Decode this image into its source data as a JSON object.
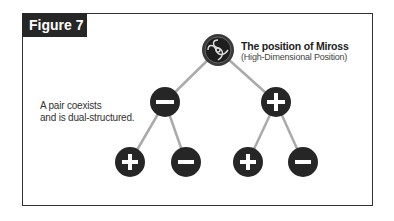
{
  "figure": {
    "label": "Figure 7"
  },
  "root": {
    "title": "The position of Miross",
    "subtitle": "(High-Dimensional Position)",
    "icon": "miross-knot-icon"
  },
  "annotation": {
    "line1": "A pair coexists",
    "line2": "and is dual-structured."
  },
  "nodes": {
    "level1": [
      {
        "sign": "minus",
        "symbol": "−"
      },
      {
        "sign": "plus",
        "symbol": "+"
      }
    ],
    "level2": [
      {
        "sign": "plus",
        "symbol": "+"
      },
      {
        "sign": "minus",
        "symbol": "−"
      },
      {
        "sign": "plus",
        "symbol": "+"
      },
      {
        "sign": "minus",
        "symbol": "−"
      }
    ]
  },
  "colors": {
    "node_fill": "#262626",
    "edge": "#aaaaaa",
    "frame": "#333333"
  }
}
